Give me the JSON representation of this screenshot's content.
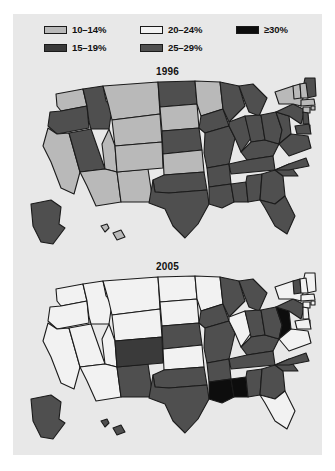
{
  "figure": {
    "background_color": "#e8e8e8",
    "page_background_color": "#ffffff"
  },
  "legend": {
    "name": "prevalence-legend",
    "columns": [
      {
        "items": [
          {
            "label": "10–14%",
            "color": "#b9b9b9",
            "key": "10-14"
          },
          {
            "label": "15–19%",
            "color": "#3a3a3a",
            "key": "15-19"
          }
        ]
      },
      {
        "items": [
          {
            "label": "20–24%",
            "color": "#f2f2f2",
            "key": "20-24"
          },
          {
            "label": "25–29%",
            "color": "#4f4f4f",
            "key": "25-29"
          }
        ]
      },
      {
        "items": [
          {
            "label": "≥30%",
            "color": "#0d0d0d",
            "key": "30plus"
          }
        ]
      }
    ]
  },
  "maps": [
    {
      "id": "map-1996",
      "title": "1996",
      "states": {
        "WA": "10-14",
        "OR": "25-29",
        "CA": "10-14",
        "NV": "25-29",
        "ID": "25-29",
        "MT": "10-14",
        "WY": "10-14",
        "UT": "10-14",
        "AZ": "10-14",
        "NM": "10-14",
        "CO": "10-14",
        "ND": "25-29",
        "SD": "10-14",
        "NE": "25-29",
        "KS": "10-14",
        "OK": "25-29",
        "TX": "25-29",
        "MN": "10-14",
        "IA": "25-29",
        "MO": "25-29",
        "AR": "25-29",
        "LA": "25-29",
        "WI": "25-29",
        "IL": "25-29",
        "MS": "25-29",
        "MI": "25-29",
        "IN": "25-29",
        "KY": "25-29",
        "TN": "25-29",
        "AL": "25-29",
        "OH": "25-29",
        "WV": "25-29",
        "GA": "25-29",
        "FL": "25-29",
        "SC": "25-29",
        "NC": "25-29",
        "VA": "25-29",
        "PA": "25-29",
        "NY": "10-14",
        "ME": "25-29",
        "VT": "10-14",
        "NH": "10-14",
        "MA": "10-14",
        "RI": "10-14",
        "CT": "10-14",
        "NJ": "25-29",
        "DE": "25-29",
        "MD": "25-29",
        "AK": "25-29",
        "HI": "10-14"
      }
    },
    {
      "id": "map-2005",
      "title": "2005",
      "states": {
        "WA": "20-24",
        "OR": "20-24",
        "CA": "20-24",
        "NV": "20-24",
        "ID": "20-24",
        "MT": "20-24",
        "WY": "20-24",
        "UT": "20-24",
        "AZ": "20-24",
        "NM": "25-29",
        "CO": "15-19",
        "ND": "20-24",
        "SD": "20-24",
        "NE": "25-29",
        "KS": "20-24",
        "OK": "25-29",
        "TX": "25-29",
        "MN": "20-24",
        "IA": "25-29",
        "MO": "25-29",
        "AR": "25-29",
        "LA": "30plus",
        "WI": "25-29",
        "IL": "20-24",
        "MS": "30plus",
        "MI": "25-29",
        "IN": "25-29",
        "KY": "25-29",
        "TN": "25-29",
        "AL": "25-29",
        "OH": "25-29",
        "WV": "30plus",
        "GA": "25-29",
        "FL": "20-24",
        "SC": "25-29",
        "NC": "25-29",
        "VA": "20-24",
        "PA": "25-29",
        "NY": "20-24",
        "ME": "20-24",
        "VT": "25-29",
        "NH": "20-24",
        "MA": "20-24",
        "RI": "20-24",
        "CT": "20-24",
        "NJ": "20-24",
        "DE": "20-24",
        "MD": "20-24",
        "AK": "25-29",
        "HI": "25-29"
      }
    }
  ]
}
